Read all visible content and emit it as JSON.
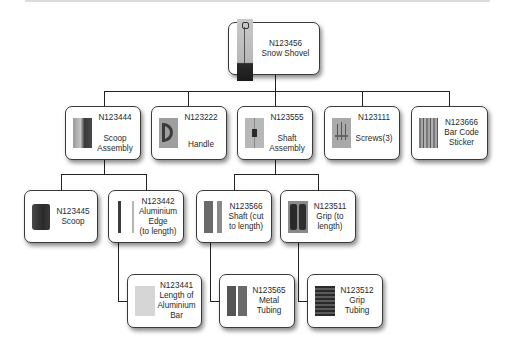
{
  "diagram": {
    "type": "bill-of-materials-tree",
    "root": {
      "id": "N123456",
      "name": "Snow Shovel",
      "icon": "snow-shovel-image"
    },
    "level1": [
      {
        "id": "N123444",
        "name": "Scoop Assembly",
        "icon": "scoop-assembly-image"
      },
      {
        "id": "N123222",
        "name": "Handle",
        "icon": "handle-image"
      },
      {
        "id": "N123555",
        "name": "Shaft Assembly",
        "icon": "shaft-assembly-image"
      },
      {
        "id": "N123111",
        "name": "Screws(3)",
        "icon": "screws-image"
      },
      {
        "id": "N123666",
        "name": "Bar Code Sticker",
        "icon": "bar-code-sticker-image"
      }
    ],
    "level2": [
      {
        "id": "N123445",
        "name": "Scoop",
        "parent": "N123444",
        "icon": "scoop-image"
      },
      {
        "id": "N123442",
        "name": "Aluminium Edge (to length)",
        "parent": "N123444",
        "icon": "aluminium-edge-image"
      },
      {
        "id": "N123566",
        "name": "Shaft (cut to length)",
        "parent": "N123555",
        "icon": "shaft-image"
      },
      {
        "id": "N123511",
        "name": "Grip (to length)",
        "parent": "N123555",
        "icon": "grip-image"
      }
    ],
    "level3": [
      {
        "id": "N123441",
        "name": "Length of Aluminium Bar",
        "parent": "N123442",
        "icon": "aluminium-bar-image"
      },
      {
        "id": "N123565",
        "name": "Metal Tubing",
        "parent": "N123566",
        "icon": "metal-tubing-image"
      },
      {
        "id": "N123512",
        "name": "Grip Tubing",
        "parent": "N123511",
        "icon": "grip-tubing-image"
      }
    ]
  },
  "labels": {
    "root": {
      "line1": "N123456",
      "line2": "Snow Shovel"
    },
    "scoop_assembly": {
      "line1": "N123444",
      "line2": "Scoop",
      "line3": "Assembly"
    },
    "handle": {
      "line1": "N123222",
      "line2": "Handle"
    },
    "shaft_assembly": {
      "line1": "N123555",
      "line2": "Shaft",
      "line3": "Assembly"
    },
    "screws": {
      "line1": "N123111",
      "line2": "Screws(3)"
    },
    "bar_code": {
      "line1": "N123666",
      "line2": "Bar Code",
      "line3": "Sticker"
    },
    "scoop": {
      "line1": "N123445",
      "line2": "Scoop"
    },
    "aluminium_edge": {
      "line1": "N123442",
      "line2": "Aluminium",
      "line3": "Edge",
      "line4": "(to length)"
    },
    "shaft": {
      "line1": "N123566",
      "line2": "Shaft (cut",
      "line3": "to length)"
    },
    "grip": {
      "line1": "N123511",
      "line2": "Grip (to",
      "line3": "length)"
    },
    "aluminium_bar": {
      "line1": "N123441",
      "line2": "Length of",
      "line3": "Aluminium",
      "line4": "Bar"
    },
    "metal_tubing": {
      "line1": "N123565",
      "line2": "Metal",
      "line3": "Tubing"
    },
    "grip_tubing": {
      "line1": "N123512",
      "line2": "Grip",
      "line3": "Tubing"
    }
  },
  "colors": {
    "border": "#3a3a3a",
    "line": "#222222",
    "text": "#2a2a2a",
    "background": "#ffffff"
  }
}
